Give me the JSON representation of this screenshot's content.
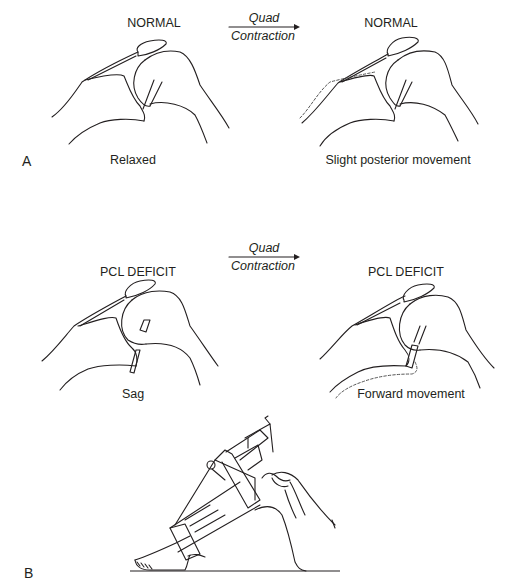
{
  "figure": {
    "panel_a": {
      "letter": "A",
      "arrow_label_top": "Quad",
      "arrow_label_bottom": "Contraction",
      "left": {
        "title": "NORMAL",
        "caption": "Relaxed"
      },
      "right": {
        "title": "NORMAL",
        "caption": "Slight posterior movement"
      }
    },
    "panel_a2": {
      "arrow_label_top": "Quad",
      "arrow_label_bottom": "Contraction",
      "left": {
        "title": "PCL DEFICIT",
        "caption": "Sag"
      },
      "right": {
        "title": "PCL DEFICIT",
        "caption": "Forward movement"
      }
    },
    "panel_b": {
      "letter": "B"
    }
  }
}
